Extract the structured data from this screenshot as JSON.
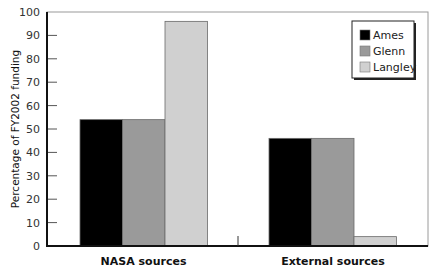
{
  "chart_data": {
    "type": "bar",
    "title": "",
    "xlabel": "",
    "ylabel": "Percentage of FY2002 funding",
    "ylim": [
      0,
      100
    ],
    "yticks": [
      0,
      10,
      20,
      30,
      40,
      50,
      60,
      70,
      80,
      90,
      100
    ],
    "grid": false,
    "legend_position": "upper right",
    "categories": [
      "NASA sources",
      "External sources"
    ],
    "series": [
      {
        "name": "Ames",
        "color": "#000000",
        "values": [
          54,
          46
        ]
      },
      {
        "name": "Glenn",
        "color": "#9a9a9a",
        "values": [
          54,
          46
        ]
      },
      {
        "name": "Langley",
        "color": "#d0d0d0",
        "values": [
          96,
          4
        ]
      }
    ]
  }
}
